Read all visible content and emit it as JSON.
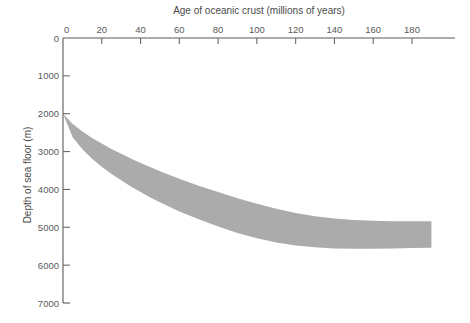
{
  "chart_data": {
    "type": "area",
    "title": "",
    "xlabel": "Age of oceanic crust (millions of years)",
    "ylabel": "Depth of sea floor (m)",
    "xlim": [
      0,
      190
    ],
    "ylim": [
      7000,
      0
    ],
    "y_inverted": true,
    "grid": false,
    "legend": null,
    "x_ticks": [
      0,
      20,
      40,
      60,
      80,
      100,
      120,
      140,
      160,
      180
    ],
    "x_tick_labels": [
      "0",
      "20",
      "40",
      "60",
      "80",
      "100",
      "120",
      "140",
      "160",
      "180"
    ],
    "y_ticks": [
      0,
      1000,
      2000,
      3000,
      4000,
      5000,
      6000,
      7000
    ],
    "y_tick_labels": [
      "0",
      "1000",
      "2000",
      "3000",
      "4000",
      "5000",
      "6000",
      "7000"
    ],
    "series": [
      {
        "name": "Depth envelope of oceanic crust (upper bound)",
        "x": [
          0,
          5,
          10,
          15,
          20,
          25,
          30,
          35,
          40,
          45,
          50,
          60,
          70,
          80,
          90,
          100,
          110,
          120,
          130,
          140,
          150,
          160,
          170,
          180,
          190
        ],
        "values": [
          2000,
          2270,
          2470,
          2640,
          2790,
          2930,
          3060,
          3180,
          3300,
          3410,
          3520,
          3720,
          3900,
          4070,
          4230,
          4380,
          4510,
          4620,
          4710,
          4770,
          4810,
          4830,
          4840,
          4840,
          4840
        ]
      },
      {
        "name": "Depth envelope of oceanic crust (lower bound)",
        "x": [
          0,
          5,
          10,
          15,
          20,
          25,
          30,
          35,
          40,
          45,
          50,
          60,
          70,
          80,
          90,
          100,
          110,
          120,
          130,
          140,
          150,
          160,
          170,
          180,
          190
        ],
        "values": [
          2000,
          2620,
          2940,
          3190,
          3400,
          3590,
          3760,
          3920,
          4070,
          4210,
          4340,
          4580,
          4790,
          4980,
          5150,
          5290,
          5400,
          5480,
          5530,
          5560,
          5570,
          5570,
          5560,
          5550,
          5540
        ]
      }
    ],
    "band_color": "#ababab",
    "axis_color": "#5a5a5a",
    "text_color": "#4a4a4a"
  },
  "axes": {
    "x_title": "Age of oceanic crust (millions of years)",
    "y_title": "Depth of sea floor (m)",
    "x_tick_labels": [
      "0",
      "20",
      "40",
      "60",
      "80",
      "100",
      "120",
      "140",
      "160",
      "180"
    ],
    "y_tick_labels": [
      "0",
      "1000",
      "2000",
      "3000",
      "4000",
      "5000",
      "6000",
      "7000"
    ],
    "y_origin_label": "0"
  }
}
